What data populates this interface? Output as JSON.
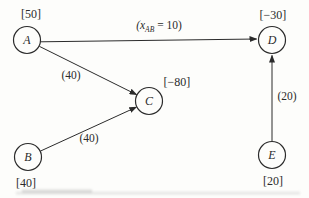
{
  "colors": {
    "background": "#fdfdfb",
    "ink": "#2b2b2b"
  },
  "nodes": [
    {
      "id": "A",
      "letter": "A",
      "value": "[50]"
    },
    {
      "id": "B",
      "letter": "B",
      "value": "[40]"
    },
    {
      "id": "C",
      "letter": "C",
      "value": "[−80]"
    },
    {
      "id": "D",
      "letter": "D",
      "value": "[−30]"
    },
    {
      "id": "E",
      "letter": "E",
      "value": "[20]"
    }
  ],
  "edges": [
    {
      "from": "A",
      "to": "D",
      "label_open": "(x",
      "label_sub": "AB",
      "label_close": " = 10)"
    },
    {
      "from": "A",
      "to": "C",
      "label": "(40)"
    },
    {
      "from": "B",
      "to": "C",
      "label": "(40)"
    },
    {
      "from": "E",
      "to": "D",
      "label": "(20)"
    }
  ]
}
